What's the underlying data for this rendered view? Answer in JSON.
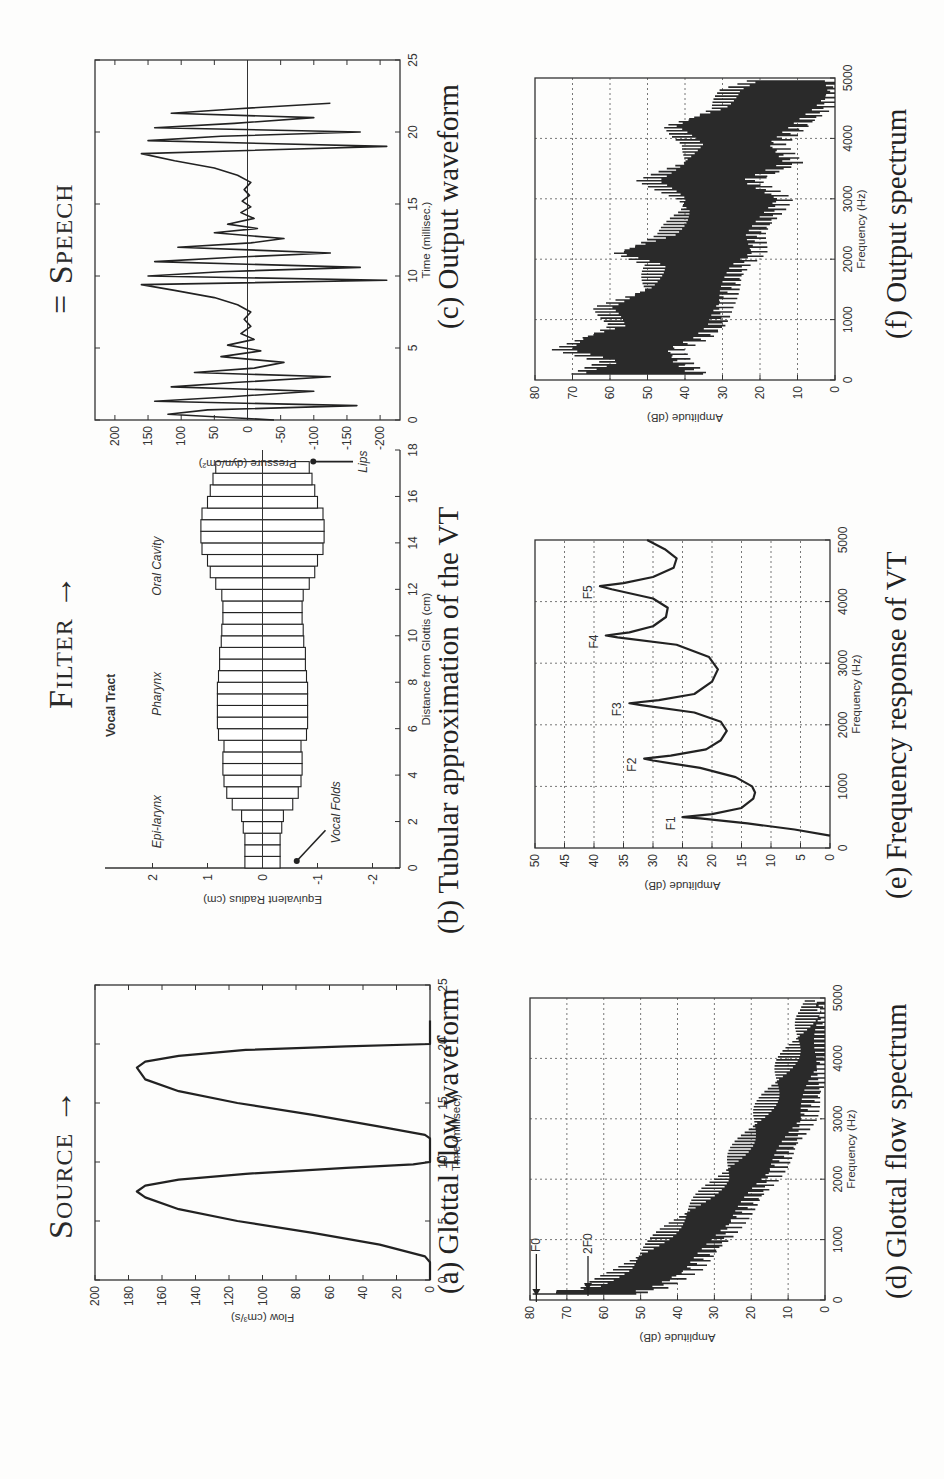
{
  "headers": {
    "source": "Source →",
    "filter": "Filter →",
    "speech": "= Speech"
  },
  "captions": {
    "a": "(a) Glottal flow waveform",
    "b": "(b) Tubular approximation of the VT",
    "c": "(c) Output waveform",
    "d": "(d) Glottal flow spectrum",
    "e": "(e) Frequency response of VT",
    "f": "(f) Output spectrum"
  },
  "chart_data": [
    {
      "id": "a",
      "type": "line",
      "title": "Glottal flow waveform",
      "xlabel": "Time (millisec.)",
      "ylabel": "Flow (cm^3/s)",
      "xlim": [
        0,
        25
      ],
      "ylim": [
        0,
        200
      ],
      "xticks": [
        0,
        5,
        10,
        15,
        20,
        25
      ],
      "yticks": [
        0,
        20,
        40,
        60,
        80,
        100,
        120,
        140,
        160,
        180,
        200
      ],
      "grid": false,
      "x": [
        0,
        1.5,
        2,
        3,
        4,
        5,
        6,
        7,
        7.5,
        8,
        8.5,
        9,
        9.5,
        9.8,
        10,
        11,
        12,
        12.3,
        13,
        14,
        15,
        16,
        17,
        18,
        18.5,
        19,
        19.5,
        19.8,
        20,
        21,
        22
      ],
      "y": [
        0,
        0,
        3,
        30,
        70,
        115,
        150,
        170,
        175,
        170,
        150,
        110,
        50,
        10,
        0,
        0,
        0,
        3,
        30,
        70,
        115,
        150,
        170,
        175,
        170,
        150,
        110,
        50,
        0,
        0,
        0
      ]
    },
    {
      "id": "b",
      "type": "bar",
      "title": "Vocal Tract",
      "xlabel": "Distance from Glottis (cm)",
      "ylabel": "Equivalent Radius (cm)",
      "xlim": [
        0,
        18
      ],
      "ylim": [
        -2.5,
        2.5
      ],
      "xticks": [
        0,
        2,
        4,
        6,
        8,
        10,
        12,
        14,
        16,
        18
      ],
      "yticks": [
        -2,
        -1,
        0,
        1,
        2
      ],
      "annotations": [
        {
          "text": "Epi-larynx",
          "x": 2,
          "y": 1.85
        },
        {
          "text": "Pharynx",
          "x": 7.5,
          "y": 1.85
        },
        {
          "text": "Oral Cavity",
          "x": 13,
          "y": 1.85
        },
        {
          "text": "Vocal Folds",
          "x": 2.4,
          "y": -1.4,
          "arrow_to": [
            0.3,
            -0.55
          ]
        },
        {
          "text": "Lips",
          "x": 17.5,
          "y": -1.9,
          "arrow_to": [
            17.5,
            -0.85
          ]
        }
      ],
      "segment_width_cm": 0.5,
      "radius": [
        0.32,
        0.32,
        0.32,
        0.35,
        0.38,
        0.55,
        0.65,
        0.7,
        0.72,
        0.72,
        0.7,
        0.8,
        0.82,
        0.82,
        0.82,
        0.82,
        0.8,
        0.78,
        0.78,
        0.75,
        0.74,
        0.72,
        0.72,
        0.74,
        0.85,
        0.95,
        1.0,
        1.1,
        1.12,
        1.12,
        1.1,
        1.0,
        0.95,
        0.9,
        0.85
      ]
    },
    {
      "id": "c",
      "type": "line",
      "title": "Output waveform",
      "xlabel": "Time (millisec.)",
      "ylabel": "Pressure (dyn/cm^2)",
      "xlim": [
        0,
        25
      ],
      "ylim": [
        -230,
        230
      ],
      "xticks": [
        0,
        5,
        10,
        15,
        20,
        25
      ],
      "yticks": [
        -200,
        -150,
        -100,
        -50,
        0,
        50,
        100,
        150,
        200
      ],
      "grid": false,
      "x": [
        0,
        0.4,
        0.7,
        1.0,
        1.3,
        1.6,
        2.0,
        2.3,
        2.6,
        3.0,
        3.3,
        3.6,
        4.0,
        4.4,
        4.8,
        5.2,
        5.6,
        6.0,
        6.5,
        7.0,
        7.5,
        8.0,
        8.5,
        9.0,
        9.4,
        9.7,
        10.0,
        10.3,
        10.6,
        11.0,
        11.3,
        11.6,
        12.0,
        12.3,
        12.6,
        13.0,
        13.3,
        13.6,
        14.0,
        14.4,
        14.8,
        15.2,
        15.6,
        16.0,
        16.5,
        17.0,
        17.5,
        18.0,
        18.5,
        19.0,
        19.4,
        19.7,
        20.0,
        20.3,
        20.6,
        21.0,
        21.3,
        21.6,
        22.0
      ],
      "y": [
        -40,
        120,
        60,
        -165,
        140,
        30,
        -100,
        115,
        20,
        -125,
        80,
        -10,
        -55,
        40,
        -20,
        30,
        -10,
        10,
        -5,
        5,
        -5,
        15,
        50,
        110,
        160,
        -210,
        150,
        40,
        -170,
        140,
        20,
        -125,
        105,
        -5,
        -55,
        50,
        -15,
        30,
        -10,
        10,
        -5,
        8,
        -3,
        5,
        -5,
        15,
        50,
        110,
        160,
        -210,
        150,
        40,
        -170,
        140,
        20,
        -100,
        115,
        20,
        -125
      ]
    },
    {
      "id": "d",
      "type": "bar",
      "title": "Glottal flow spectrum",
      "xlabel": "Frequency (Hz)",
      "ylabel": "Amplitude (dB)",
      "xlim": [
        0,
        5000
      ],
      "ylim": [
        0,
        80
      ],
      "xticks": [
        0,
        1000,
        2000,
        3000,
        4000,
        5000
      ],
      "yticks": [
        0,
        10,
        20,
        30,
        40,
        50,
        60,
        70,
        80
      ],
      "grid": true,
      "annotations": [
        {
          "text": "F0",
          "x": 100,
          "y": 78
        },
        {
          "text": "2F0",
          "x": 200,
          "y": 64
        }
      ],
      "harmonic_spacing_hz": 100,
      "envelope": {
        "freq": [
          100,
          200,
          500,
          1000,
          2000,
          3000,
          4000,
          4800
        ],
        "top_db": [
          78,
          64,
          55,
          45,
          28,
          18,
          10,
          4
        ],
        "bottom_db": [
          52,
          45,
          36,
          28,
          15,
          5,
          0,
          0
        ]
      }
    },
    {
      "id": "e",
      "type": "line",
      "title": "Frequency response of VT",
      "xlabel": "Frequency (Hz)",
      "ylabel": "Amplitude (dB)",
      "xlim": [
        0,
        5000
      ],
      "ylim": [
        0,
        50
      ],
      "xticks": [
        0,
        1000,
        2000,
        3000,
        4000,
        5000
      ],
      "yticks": [
        0,
        5,
        10,
        15,
        20,
        25,
        30,
        35,
        40,
        45,
        50
      ],
      "grid": true,
      "annotations": [
        {
          "text": "F1",
          "x": 500,
          "y": 25
        },
        {
          "text": "F2",
          "x": 1450,
          "y": 31.5
        },
        {
          "text": "F3",
          "x": 2350,
          "y": 34
        },
        {
          "text": "F4",
          "x": 3450,
          "y": 38
        },
        {
          "text": "F5",
          "x": 4250,
          "y": 39
        }
      ],
      "x": [
        200,
        300,
        400,
        480,
        500,
        550,
        650,
        800,
        900,
        1000,
        1150,
        1300,
        1420,
        1450,
        1500,
        1600,
        1750,
        1900,
        2050,
        2200,
        2320,
        2350,
        2400,
        2500,
        2700,
        2900,
        3100,
        3300,
        3420,
        3450,
        3500,
        3600,
        3750,
        3900,
        4050,
        4200,
        4250,
        4300,
        4400,
        4550,
        4700,
        4850,
        5000
      ],
      "y": [
        0,
        6,
        14,
        22,
        25,
        20,
        15,
        13,
        12.7,
        13.2,
        16,
        22,
        30,
        31.5,
        27,
        21,
        18.5,
        17.5,
        18.5,
        23,
        32,
        34,
        29,
        23,
        20,
        19,
        20.5,
        26,
        36,
        38,
        34,
        30,
        27.8,
        27.5,
        30,
        37,
        39,
        35,
        30,
        26.5,
        26,
        28,
        31
      ]
    },
    {
      "id": "f",
      "type": "bar",
      "title": "Output spectrum",
      "xlabel": "Frequency (Hz)",
      "ylabel": "Amplitude (dB)",
      "xlim": [
        0,
        5000
      ],
      "ylim": [
        0,
        80
      ],
      "xticks": [
        0,
        1000,
        2000,
        3000,
        4000,
        5000
      ],
      "yticks": [
        0,
        10,
        20,
        30,
        40,
        50,
        60,
        70,
        80
      ],
      "grid": true,
      "harmonic_spacing_hz": 100,
      "envelope": {
        "freq": [
          0,
          100,
          300,
          500,
          700,
          900,
          1200,
          1500,
          1900,
          2100,
          2400,
          2800,
          3000,
          3300,
          3600,
          3900,
          4200,
          4500,
          4800,
          5000
        ],
        "top_db": [
          37,
          69,
          60,
          73,
          67,
          58,
          62,
          50,
          48,
          58,
          45,
          40,
          41,
          50,
          40,
          38,
          44,
          31,
          28,
          20
        ],
        "bottom_db": [
          22,
          36,
          41,
          43,
          35,
          31,
          30,
          28,
          25,
          21,
          21,
          16,
          14,
          22,
          11,
          16,
          9,
          3,
          0,
          0
        ]
      }
    }
  ]
}
